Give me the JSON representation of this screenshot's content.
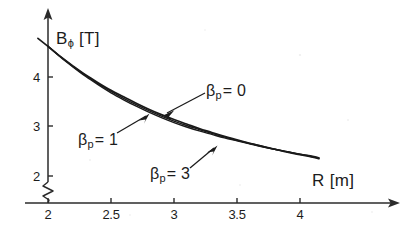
{
  "chart_data": {
    "type": "line",
    "title": "",
    "subtitle": "",
    "xlabel": "R",
    "xunit": "[m]",
    "ylabel": "B",
    "ylabel_sub": "ϕ",
    "yunit": "[T]",
    "xlim": [
      1.9,
      4.45
    ],
    "ylim": [
      1.72,
      4.95
    ],
    "y_axis_break": true,
    "grid": false,
    "legend": "annotations-with-arrows",
    "xticks": [
      2,
      2.5,
      3,
      3.5,
      4
    ],
    "xtick_labels": [
      "2",
      "2.5",
      "3",
      "3.5",
      "4"
    ],
    "yticks": [
      2,
      3,
      4
    ],
    "ytick_labels": [
      "2",
      "3",
      "4"
    ],
    "x": [
      2.0,
      2.1,
      2.2,
      2.3,
      2.4,
      2.5,
      2.6,
      2.7,
      2.8,
      2.9,
      3.0,
      3.1,
      3.2,
      3.3,
      3.4,
      3.5,
      3.6,
      3.7,
      3.8,
      3.9,
      4.0,
      4.1,
      4.15
    ],
    "series": [
      {
        "name": "βp = 0",
        "beta_p": 0,
        "values": [
          4.62,
          4.41,
          4.22,
          4.04,
          3.88,
          3.73,
          3.6,
          3.47,
          3.35,
          3.24,
          3.14,
          3.05,
          2.96,
          2.88,
          2.8,
          2.73,
          2.66,
          2.6,
          2.54,
          2.48,
          2.43,
          2.38,
          2.35
        ]
      },
      {
        "name": "βp = 1",
        "beta_p": 1,
        "values": [
          4.62,
          4.41,
          4.21,
          4.03,
          3.86,
          3.71,
          3.57,
          3.44,
          3.32,
          3.21,
          3.11,
          3.02,
          2.94,
          2.86,
          2.79,
          2.72,
          2.66,
          2.6,
          2.54,
          2.49,
          2.44,
          2.39,
          2.36
        ]
      },
      {
        "name": "βp = 3",
        "beta_p": 3,
        "values": [
          4.62,
          4.4,
          4.2,
          4.01,
          3.84,
          3.68,
          3.54,
          3.41,
          3.29,
          3.18,
          3.08,
          2.99,
          2.91,
          2.84,
          2.77,
          2.71,
          2.65,
          2.59,
          2.54,
          2.49,
          2.44,
          2.4,
          2.37
        ]
      }
    ],
    "annotations": [
      {
        "name": "beta-p-0",
        "beta": "β",
        "sub": "p",
        "eq": "= 0"
      },
      {
        "name": "beta-p-1",
        "beta": "β",
        "sub": "p",
        "eq": "= 1"
      },
      {
        "name": "beta-p-3",
        "beta": "β",
        "sub": "p",
        "eq": "= 3"
      }
    ],
    "colors": {
      "axis": "#2b2b2b",
      "curve": "#1a1a1a",
      "background": "#ffffff"
    }
  }
}
